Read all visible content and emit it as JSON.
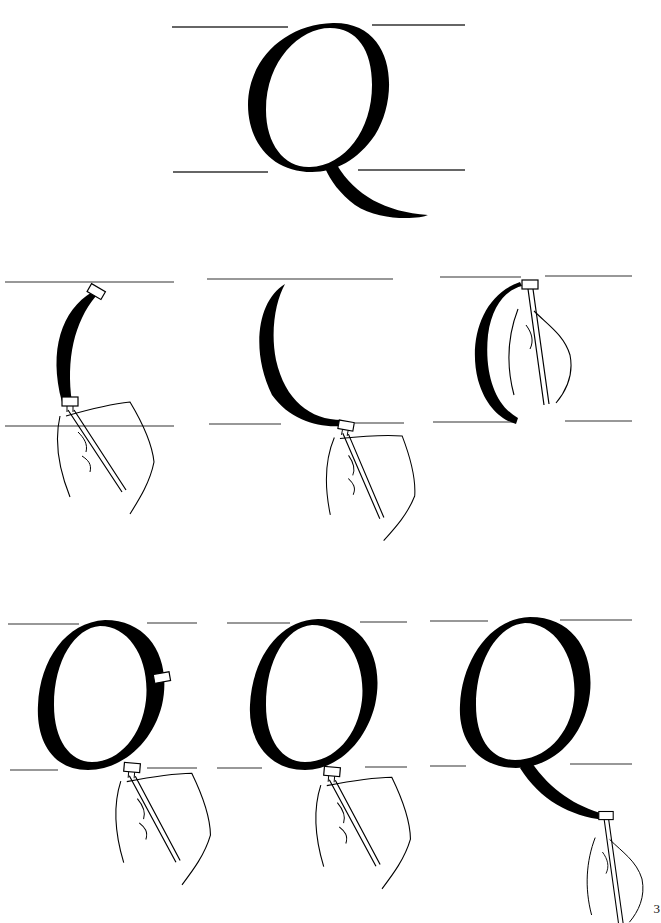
{
  "page": {
    "page_number": "3"
  },
  "hero": {
    "letter": "Q",
    "label": "completed-letter-q"
  },
  "steps": [
    {
      "id": 1,
      "row": 1,
      "col": 1,
      "desc": "first stroke: left outer curve downstroke, pen at start and end"
    },
    {
      "id": 2,
      "row": 1,
      "col": 2,
      "desc": "first stroke completed, pen at base"
    },
    {
      "id": 3,
      "row": 1,
      "col": 3,
      "desc": "pen returns to top to begin right stroke"
    },
    {
      "id": 4,
      "row": 2,
      "col": 1,
      "desc": "second stroke: right curve of bowl, pen at end"
    },
    {
      "id": 5,
      "row": 2,
      "col": 2,
      "desc": "bowl completed, pen at base for tail"
    },
    {
      "id": 6,
      "row": 2,
      "col": 3,
      "desc": "third stroke: tail sweeps right, pen at end"
    }
  ],
  "colors": {
    "ink": "#000000",
    "guideline": "#333333",
    "paper": "#ffffff"
  }
}
